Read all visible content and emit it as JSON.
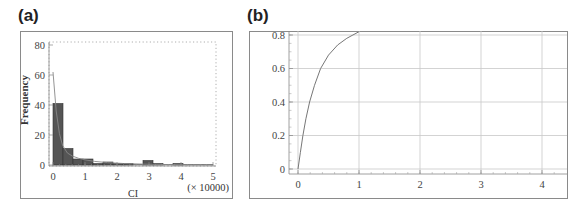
{
  "panels": {
    "a": {
      "label": "(a)"
    },
    "b": {
      "label": "(b)"
    }
  },
  "chart_data": [
    {
      "type": "bar",
      "panel": "(a)",
      "title": "",
      "xlabel": "CI",
      "ylabel": "Frequency",
      "x_multiplier_label": "(× 10000)",
      "xlim": [
        0,
        5
      ],
      "ylim": [
        0,
        80
      ],
      "xticks": [
        "0",
        "1",
        "2",
        "3",
        "4",
        "5"
      ],
      "yticks": [
        "0",
        "20",
        "40",
        "60",
        "80"
      ],
      "bin_width": 0.3125,
      "bin_starts": [
        0,
        0.3125,
        0.625,
        0.9375,
        1.25,
        1.5625,
        1.875,
        2.1875,
        2.5,
        2.8125,
        3.125,
        3.4375,
        3.75,
        4.0625,
        4.375,
        4.6875
      ],
      "values": [
        41,
        11,
        4,
        4,
        1,
        2,
        1,
        1,
        0,
        3,
        1,
        0,
        1,
        0,
        0,
        0
      ],
      "fit_curve": {
        "name": "fitted density",
        "x": [
          0,
          0.1,
          0.2,
          0.3,
          0.45,
          0.6,
          0.8,
          1.0,
          1.3,
          1.7,
          2.2,
          3.0,
          4.0,
          5.0
        ],
        "y": [
          62,
          36,
          21,
          13,
          8,
          6,
          4.5,
          3.5,
          2.4,
          1.6,
          1.0,
          0.5,
          0.2,
          0.1
        ]
      },
      "grid": false,
      "colors": {
        "bar": "#555555",
        "curve": "#888888"
      }
    },
    {
      "type": "line",
      "panel": "(b)",
      "title": "",
      "xlabel": "",
      "ylabel": "",
      "xlim": [
        0,
        4.4
      ],
      "ylim": [
        0,
        0.82
      ],
      "xticks": [
        "0",
        "1",
        "2",
        "3",
        "4"
      ],
      "yticks": [
        "0",
        "0.2",
        "0.4",
        "0.6",
        "0.8"
      ],
      "grid": true,
      "series": [
        {
          "name": "cumulative",
          "x": [
            0,
            0.04,
            0.08,
            0.13,
            0.19,
            0.27,
            0.37,
            0.5,
            0.65,
            0.8,
            0.9,
            1.0
          ],
          "y": [
            0,
            0.1,
            0.2,
            0.3,
            0.4,
            0.5,
            0.6,
            0.68,
            0.74,
            0.78,
            0.8,
            0.82
          ]
        }
      ],
      "colors": {
        "line": "#777777",
        "grid": "#c8c8c8"
      }
    }
  ]
}
